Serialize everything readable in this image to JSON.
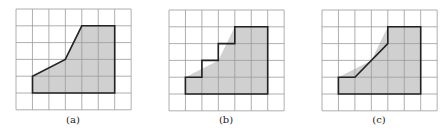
{
  "figure": {
    "grid": {
      "cols": 7,
      "rows": 6
    },
    "colors": {
      "fill": "#d0d0d0",
      "grid": "#9a9a9a",
      "outline": "#222222",
      "background": "#ffffff"
    },
    "original_polygon": [
      [
        1,
        5
      ],
      [
        1,
        4
      ],
      [
        3,
        3
      ],
      [
        4,
        1
      ],
      [
        6,
        1
      ],
      [
        6,
        5
      ]
    ],
    "panels": [
      {
        "label": "(a)",
        "origin": [
          16,
          9
        ],
        "cell": [
          16.45,
          16.8
        ],
        "outline": [
          [
            1,
            5
          ],
          [
            1,
            4
          ],
          [
            3,
            3
          ],
          [
            4,
            1
          ],
          [
            6,
            1
          ],
          [
            6,
            5
          ]
        ]
      },
      {
        "label": "(b)",
        "origin": [
          169,
          10
        ],
        "cell": [
          16.45,
          16.8
        ],
        "outline": [
          [
            1,
            5
          ],
          [
            1,
            4
          ],
          [
            2,
            4
          ],
          [
            2,
            3
          ],
          [
            3,
            3
          ],
          [
            3,
            2
          ],
          [
            4,
            2
          ],
          [
            4,
            1
          ],
          [
            6,
            1
          ],
          [
            6,
            5
          ]
        ]
      },
      {
        "label": "(c)",
        "origin": [
          322,
          10
        ],
        "cell": [
          16.45,
          16.8
        ],
        "outline": [
          [
            1,
            5
          ],
          [
            1,
            4
          ],
          [
            2,
            4
          ],
          [
            4,
            2
          ],
          [
            4,
            1
          ],
          [
            6,
            1
          ],
          [
            6,
            5
          ]
        ]
      }
    ]
  }
}
